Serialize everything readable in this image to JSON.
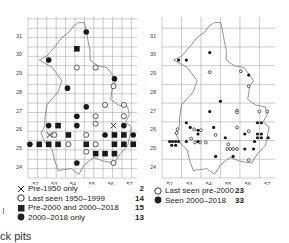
{
  "chart_data": [
    {
      "type": "scatter",
      "title": "",
      "xlabel": "",
      "ylabel": "",
      "x_ticks": [
        "52",
        "53",
        "54",
        "55",
        "56",
        "57"
      ],
      "y_ticks": [
        "24",
        "25",
        "26",
        "27",
        "28",
        "29",
        "30",
        "31"
      ],
      "grid": true,
      "grid_resolution": "2 km",
      "legend_position": "bottom",
      "_note": "Point coordinates are visual estimates from zoomed crops, not an exact transcription. Counts are from the legend; plotted point lists are approximate and do not match legend totals (e.g. 12 open circles vs legend 14).",
      "series": [
        {
          "name": "Pre-1950 only",
          "marker": "x",
          "count": 2,
          "points_approx": [
            [
              52.75,
              25.7
            ],
            [
              56.15,
              26.2
            ]
          ]
        },
        {
          "name": "Last seen 1950–1999",
          "marker": "open-circle",
          "count": 14,
          "points_approx": [
            [
              54.2,
              29.3
            ],
            [
              55.2,
              29.3
            ],
            [
              56.15,
              28.3
            ],
            [
              55.7,
              27.3
            ],
            [
              56.7,
              27.3
            ],
            [
              55.2,
              26.7
            ],
            [
              56.7,
              26.7
            ],
            [
              55.2,
              26.3
            ],
            [
              53.0,
              25.7
            ],
            [
              54.7,
              25.7
            ],
            [
              53.75,
              25.2
            ],
            [
              55.2,
              25.2
            ],
            [
              54.7,
              24.8
            ],
            [
              56.15,
              24.2
            ]
          ]
        },
        {
          "name": "Pre-2000 and 2000–2018",
          "marker": "filled-square",
          "count": 15,
          "points_approx": [
            [
              54.2,
              30.3
            ],
            [
              53.2,
              26.2
            ],
            [
              53.75,
              25.7
            ],
            [
              52.2,
              25.2
            ],
            [
              52.7,
              25.2
            ],
            [
              53.2,
              25.2
            ],
            [
              54.7,
              25.2
            ],
            [
              56.2,
              25.7
            ],
            [
              56.7,
              25.7
            ],
            [
              56.2,
              25.2
            ],
            [
              56.7,
              25.2
            ],
            [
              57.2,
              25.2
            ],
            [
              55.2,
              24.7
            ],
            [
              55.7,
              24.7
            ],
            [
              56.2,
              24.7
            ]
          ]
        },
        {
          "name": "2000–2018 only",
          "marker": "filled-circle",
          "count": 13,
          "points_approx": [
            [
              54.7,
              31.2
            ],
            [
              52.7,
              29.7
            ],
            [
              56.2,
              28.7
            ],
            [
              53.7,
              28.2
            ],
            [
              54.7,
              27.2
            ],
            [
              54.2,
              26.7
            ],
            [
              52.7,
              26.2
            ],
            [
              54.2,
              26.2
            ],
            [
              56.7,
              26.2
            ],
            [
              55.7,
              25.7
            ],
            [
              57.2,
              25.7
            ],
            [
              51.7,
              25.2
            ],
            [
              54.2,
              24.2
            ]
          ]
        }
      ]
    },
    {
      "type": "scatter",
      "title": "",
      "xlabel": "",
      "ylabel": "",
      "x_ticks": [
        "52",
        "53",
        "54",
        "55",
        "56",
        "57"
      ],
      "y_ticks": [
        "24",
        "25",
        "26",
        "27",
        "28",
        "29",
        "30",
        "31"
      ],
      "grid": true,
      "grid_resolution": "10 km",
      "legend_position": "bottom",
      "_note": "Point coordinates are visual estimates from zoomed crops, not an exact transcription. Counts are from the legend.",
      "series": [
        {
          "name": "Last seen pre-2000",
          "marker": "open-circle",
          "count": 23,
          "points_approx": [
            [
              54.05,
              29.05
            ],
            [
              55.65,
              29.1
            ],
            [
              56.05,
              28.3
            ],
            [
              55.45,
              27.0
            ],
            [
              55.45,
              26.9
            ],
            [
              56.6,
              26.95
            ],
            [
              57.0,
              26.95
            ],
            [
              52.4,
              26.0
            ],
            [
              52.35,
              25.8
            ],
            [
              53.25,
              26.0
            ],
            [
              53.6,
              25.95
            ],
            [
              53.1,
              25.5
            ],
            [
              53.3,
              25.3
            ],
            [
              53.55,
              25.3
            ],
            [
              53.85,
              25.3
            ],
            [
              54.35,
              25.7
            ],
            [
              55.45,
              26.1
            ],
            [
              55.0,
              25.2
            ],
            [
              54.95,
              24.95
            ],
            [
              55.1,
              24.95
            ],
            [
              55.25,
              24.95
            ],
            [
              55.45,
              24.95
            ],
            [
              56.05,
              24.35
            ],
            [
              56.05,
              25.9
            ]
          ]
        },
        {
          "name": "Seen 2000–2018",
          "marker": "filled-circle",
          "count": 33,
          "points_approx": [
            [
              52.45,
              29.7
            ],
            [
              52.85,
              29.7
            ],
            [
              54.05,
              30.1
            ],
            [
              56.05,
              28.9
            ],
            [
              54.6,
              27.5
            ],
            [
              54.05,
              26.95
            ],
            [
              52.85,
              26.35
            ],
            [
              53.05,
              26.1
            ],
            [
              53.45,
              25.95
            ],
            [
              53.45,
              25.75
            ],
            [
              54.25,
              26.1
            ],
            [
              52.0,
              25.35
            ],
            [
              52.15,
              25.35
            ],
            [
              52.3,
              25.35
            ],
            [
              52.45,
              25.35
            ],
            [
              52.1,
              25.15
            ],
            [
              52.3,
              25.15
            ],
            [
              52.85,
              25.35
            ],
            [
              53.45,
              25.35
            ],
            [
              54.85,
              25.55
            ],
            [
              55.85,
              25.75
            ],
            [
              56.5,
              26.35
            ],
            [
              56.7,
              26.35
            ],
            [
              56.5,
              25.75
            ],
            [
              56.7,
              25.75
            ],
            [
              56.5,
              25.55
            ],
            [
              56.7,
              25.55
            ],
            [
              57.05,
              25.55
            ],
            [
              56.35,
              25.35
            ],
            [
              55.85,
              24.95
            ],
            [
              56.3,
              24.95
            ],
            [
              54.35,
              24.55
            ],
            [
              55.25,
              24.55
            ]
          ]
        }
      ]
    }
  ],
  "left_map": {
    "y_labels": [
      "31",
      "30",
      "29",
      "28",
      "27",
      "26",
      "25",
      "24"
    ],
    "x_labels": [
      "52",
      "53",
      "54",
      "55",
      "56",
      "57"
    ],
    "legend": [
      {
        "symbol": "x-mark",
        "label": "Pre-1950 only",
        "count": "2"
      },
      {
        "symbol": "open-circle",
        "label": "Last seen 1950–1999",
        "count": "14"
      },
      {
        "symbol": "filled-square",
        "label": "Pre-2000 and 2000–2018",
        "count": "15"
      },
      {
        "symbol": "filled-circle",
        "label": "2000–2018 only",
        "count": "13"
      }
    ]
  },
  "right_map": {
    "y_labels": [
      "31",
      "30",
      "29",
      "28",
      "27",
      "26",
      "25",
      "24"
    ],
    "x_labels": [
      "52",
      "53",
      "54",
      "55",
      "56",
      "57"
    ],
    "legend": [
      {
        "symbol": "open-circle",
        "label": "Last seen pre-2000",
        "count": "23"
      },
      {
        "symbol": "filled-circle",
        "label": "Seen 2000–2018",
        "count": "33"
      }
    ]
  },
  "caption": "rick pits"
}
